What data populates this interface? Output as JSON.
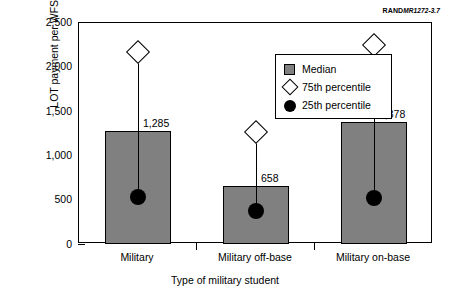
{
  "source_tag": {
    "bold": "RAND",
    "italic": "MR1272-3.7"
  },
  "legend": {
    "position": "inside-top-center",
    "entries": [
      {
        "label": "Median",
        "marker": "gray-square"
      },
      {
        "label": "75th percentile",
        "marker": "white-diamond"
      },
      {
        "label": "25th percentile",
        "marker": "black-circle"
      }
    ]
  },
  "chart_data": {
    "type": "bar",
    "title": "",
    "xlabel": "Type of military student",
    "ylabel": "LOT payment per WFSU",
    "categories": [
      "Military",
      "Military off-base",
      "Military on-base"
    ],
    "values": [
      1285,
      658,
      1378
    ],
    "data_labels": [
      "1,285",
      "658",
      "1,378"
    ],
    "series": [
      {
        "name": "Median",
        "values": [
          1285,
          658,
          1378
        ]
      },
      {
        "name": "75th percentile",
        "values": [
          2170,
          1270,
          2250
        ]
      },
      {
        "name": "25th percentile",
        "values": [
          536,
          377,
          525
        ]
      }
    ],
    "ylim": [
      0,
      2500
    ],
    "yticks": [
      0,
      500,
      1000,
      1500,
      2000,
      2500
    ],
    "ytick_labels": [
      "0",
      "500",
      "1,000",
      "1,500",
      "2,000",
      "2,500"
    ],
    "grid": false,
    "legend_position": "upper center",
    "colors": {
      "bar_fill": "#808080",
      "bar_edge": "#000000",
      "marker_75th_fill": "#ffffff",
      "marker_25th_fill": "#000000",
      "background": "#ffffff"
    }
  }
}
